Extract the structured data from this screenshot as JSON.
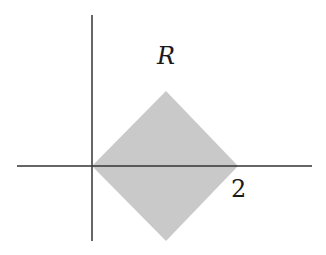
{
  "figure": {
    "region_label": "R",
    "x_tick_label": "2",
    "colors": {
      "region_fill": "#c9c9c9",
      "axis": "#333333",
      "text": "#1a1a1a",
      "background": "#ffffff"
    },
    "region": {
      "shape": "square rotated 45 degrees (diamond)",
      "vertices": [
        [
          0,
          0
        ],
        [
          1,
          1
        ],
        [
          2,
          0
        ],
        [
          1,
          -1
        ]
      ]
    }
  }
}
